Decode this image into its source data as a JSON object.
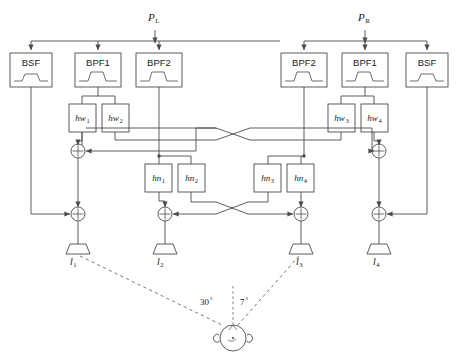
{
  "diagram": {
    "stroke_color": "#4a4a4a",
    "text_color": "#1a1a1a",
    "background": "#ffffff"
  },
  "inputs": [
    {
      "id": "p-left",
      "label": "P",
      "subscript": "L",
      "x": 150,
      "y": 22
    },
    {
      "id": "p-right",
      "label": "P",
      "subscript": "R",
      "x": 355,
      "y": 22
    }
  ],
  "filters": [
    {
      "id": "filter-bsf-left",
      "label": "BSF",
      "type": "notch",
      "x": 10,
      "y": 53,
      "w": 42,
      "h": 34
    },
    {
      "id": "filter-bpf1-left",
      "label": "BPF1",
      "type": "bump",
      "x": 75,
      "y": 53,
      "w": 46,
      "h": 34
    },
    {
      "id": "filter-bpf2-left",
      "label": "BPF2",
      "type": "bump",
      "x": 136,
      "y": 53,
      "w": 46,
      "h": 34
    },
    {
      "id": "filter-bpf2-right",
      "label": "BPF2",
      "type": "bump",
      "x": 281,
      "y": 53,
      "w": 46,
      "h": 34
    },
    {
      "id": "filter-bpf1-right",
      "label": "BPF1",
      "type": "bump",
      "x": 342,
      "y": 53,
      "w": 46,
      "h": 34
    },
    {
      "id": "filter-bsf-right",
      "label": "BSF",
      "type": "notch",
      "x": 406,
      "y": 53,
      "w": 42,
      "h": 34
    }
  ],
  "hw_blocks": [
    {
      "id": "hw1",
      "label": "hw",
      "subscript": "1",
      "x": 69,
      "y": 104,
      "w": 27,
      "h": 28
    },
    {
      "id": "hw2",
      "label": "hw",
      "subscript": "2",
      "x": 102,
      "y": 104,
      "w": 27,
      "h": 28
    },
    {
      "id": "hw3",
      "label": "hw",
      "subscript": "3",
      "x": 328,
      "y": 104,
      "w": 27,
      "h": 28
    },
    {
      "id": "hw4",
      "label": "hw",
      "subscript": "4",
      "x": 361,
      "y": 104,
      "w": 27,
      "h": 28
    }
  ],
  "hn_blocks": [
    {
      "id": "hn1",
      "label": "hn",
      "subscript": "1",
      "x": 145,
      "y": 164,
      "w": 27,
      "h": 28
    },
    {
      "id": "hn2",
      "label": "hn",
      "subscript": "2",
      "x": 178,
      "y": 164,
      "w": 27,
      "h": 28
    },
    {
      "id": "hn3",
      "label": "hn",
      "subscript": "3",
      "x": 254,
      "y": 164,
      "w": 27,
      "h": 28
    },
    {
      "id": "hn4",
      "label": "hn",
      "subscript": "4",
      "x": 287,
      "y": 164,
      "w": 27,
      "h": 28
    }
  ],
  "summers": [
    {
      "id": "sum-upper-left",
      "symbol": "+",
      "x": 78,
      "y": 151
    },
    {
      "id": "sum-upper-right",
      "symbol": "+",
      "x": 379,
      "y": 151
    },
    {
      "id": "sum-out-1",
      "symbol": "+",
      "x": 78,
      "y": 214
    },
    {
      "id": "sum-out-2",
      "symbol": "+",
      "x": 165,
      "y": 214
    },
    {
      "id": "sum-out-3",
      "symbol": "+",
      "x": 301,
      "y": 214
    },
    {
      "id": "sum-out-4",
      "symbol": "+",
      "x": 379,
      "y": 214
    }
  ],
  "speakers": [
    {
      "id": "speaker-1",
      "label": "l",
      "subscript": "1",
      "x": 78,
      "y": 243
    },
    {
      "id": "speaker-2",
      "label": "l",
      "subscript": "2",
      "x": 165,
      "y": 243
    },
    {
      "id": "speaker-3",
      "label": "l",
      "subscript": "3",
      "x": 301,
      "y": 243
    },
    {
      "id": "speaker-4",
      "label": "l",
      "subscript": "4",
      "x": 379,
      "y": 243
    }
  ],
  "listener": {
    "id": "listener-head",
    "cx": 233,
    "cy": 338,
    "radius": 13,
    "ear_label": "ear"
  },
  "angles": [
    {
      "id": "angle-30",
      "value": "30",
      "unit": "°",
      "x": 202,
      "y": 297
    },
    {
      "id": "angle-7",
      "value": "7",
      "unit": "°",
      "x": 243,
      "y": 297
    }
  ]
}
